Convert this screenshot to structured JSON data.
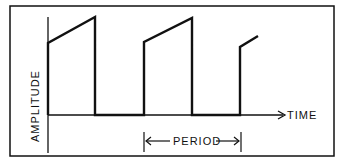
{
  "diagram": {
    "y_axis_label": "AMPLITUDE",
    "x_axis_label": "TIME",
    "period_label": "PERIOD",
    "colors": {
      "line": "#111111",
      "background": "#ffffff"
    }
  }
}
